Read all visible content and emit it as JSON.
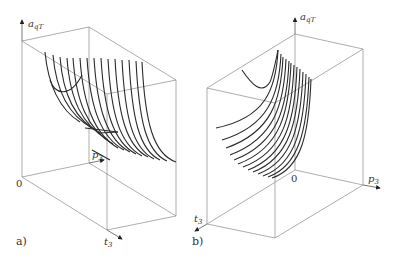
{
  "figure": {
    "panel_a": {
      "label": "a)",
      "axis_vertical": {
        "symbol": "a",
        "subscript": "qT"
      },
      "axis_depth": {
        "symbol": "p",
        "subscript": "3"
      },
      "axis_front": {
        "symbol": "t",
        "subscript": "3"
      },
      "origin": "0"
    },
    "panel_b": {
      "label": "b)",
      "axis_vertical": {
        "symbol": "a",
        "subscript": "qT"
      },
      "axis_right": {
        "symbol": "p",
        "subscript": "3"
      },
      "axis_front": {
        "symbol": "t",
        "subscript": "3"
      },
      "origin": "0"
    }
  }
}
